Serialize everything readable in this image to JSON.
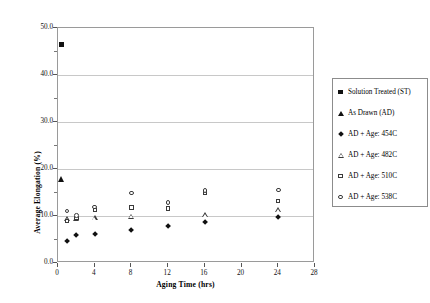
{
  "chart_data": {
    "type": "scatter",
    "title": "",
    "xlabel": "Aging Time (hrs)",
    "ylabel": "Average Elongation (%)",
    "xlim": [
      0,
      28
    ],
    "ylim": [
      0.0,
      50.0
    ],
    "xticks": [
      "0",
      "4",
      "8",
      "12",
      "16",
      "20",
      "24",
      "28"
    ],
    "yticks": [
      "0.0",
      "10.0",
      "20.0",
      "30.0",
      "40.0",
      "50.0"
    ],
    "grid": "horizontal",
    "legend_position": "right",
    "series": [
      {
        "name": "Solution Treated (ST)",
        "marker": "filled-square",
        "points": [
          [
            0.4,
            46.5
          ]
        ]
      },
      {
        "name": "As Drawn (AD)",
        "marker": "filled-triangle",
        "points": [
          [
            0.4,
            17.8
          ]
        ]
      },
      {
        "name": "AD + Age: 454C",
        "marker": "filled-diamond",
        "points": [
          [
            1,
            4.6
          ],
          [
            2,
            6.0
          ],
          [
            4,
            6.1
          ],
          [
            8,
            7.0
          ],
          [
            12,
            7.9
          ],
          [
            16,
            8.6
          ],
          [
            24,
            9.8
          ]
        ]
      },
      {
        "name": "AD + Age: 482C",
        "marker": "open-triangle",
        "points": [
          [
            1,
            9.3
          ],
          [
            2,
            9.5
          ],
          [
            4,
            9.6
          ],
          [
            8,
            9.9
          ],
          [
            16,
            10.2
          ],
          [
            24,
            11.3
          ]
        ]
      },
      {
        "name": "AD + Age: 510C",
        "marker": "open-square",
        "points": [
          [
            1,
            9.0
          ],
          [
            2,
            9.6
          ],
          [
            4,
            11.3
          ],
          [
            8,
            11.8
          ],
          [
            12,
            11.6
          ],
          [
            16,
            14.9
          ],
          [
            24,
            13.2
          ]
        ]
      },
      {
        "name": "AD + Age: 538C",
        "marker": "open-circle",
        "points": [
          [
            1,
            11.1
          ],
          [
            2,
            10.1
          ],
          [
            4,
            11.9
          ],
          [
            8,
            14.9
          ],
          [
            12,
            12.9
          ],
          [
            16,
            15.4
          ],
          [
            24,
            15.5
          ]
        ]
      }
    ]
  },
  "legend": {
    "entries": [
      {
        "label": "Solution Treated (ST)",
        "marker": "filled-square"
      },
      {
        "label": "As Drawn (AD)",
        "marker": "filled-triangle"
      },
      {
        "label": "AD + Age: 454C",
        "marker": "filled-diamond"
      },
      {
        "label": "AD + Age: 482C",
        "marker": "open-triangle"
      },
      {
        "label": "AD + Age: 510C",
        "marker": "open-square"
      },
      {
        "label": "AD + Age: 538C",
        "marker": "open-circle"
      }
    ]
  }
}
